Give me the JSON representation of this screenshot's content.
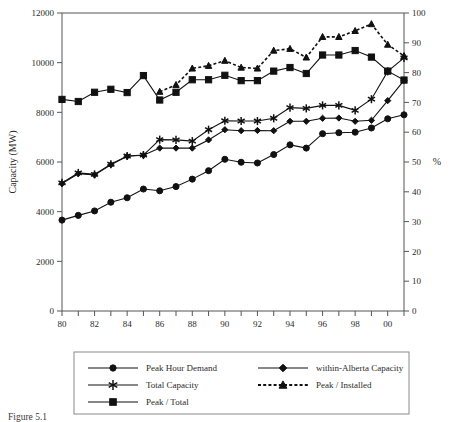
{
  "chart_data": {
    "type": "line",
    "title": "",
    "xlabel": "",
    "ylabel": "Capacity (MW)",
    "y2label": "%",
    "xlim": [
      80,
      101
    ],
    "ylim": [
      0,
      12000
    ],
    "y2lim": [
      0,
      100
    ],
    "grid": false,
    "legend_position": "below-plot",
    "x": [
      80,
      81,
      82,
      83,
      84,
      85,
      86,
      87,
      88,
      89,
      90,
      91,
      92,
      93,
      94,
      95,
      96,
      97,
      98,
      99,
      100,
      101
    ],
    "xtick_labels": [
      "80",
      "",
      "82",
      "",
      "84",
      "",
      "86",
      "",
      "88",
      "",
      "90",
      "",
      "92",
      "",
      "94",
      "",
      "96",
      "",
      "98",
      "",
      "00",
      ""
    ],
    "ytick_labels": [
      "0",
      "2000",
      "4000",
      "6000",
      "8000",
      "10000",
      "12000"
    ],
    "ytick_values": [
      0,
      2000,
      4000,
      6000,
      8000,
      10000,
      12000
    ],
    "y2tick_labels": [
      "0",
      "10",
      "20",
      "30",
      "40",
      "50",
      "60",
      "70",
      "80",
      "90",
      "100"
    ],
    "y2tick_values": [
      0,
      10,
      20,
      30,
      40,
      50,
      60,
      70,
      80,
      90,
      100
    ],
    "series": [
      {
        "name": "Peak Hour Demand",
        "marker": "circle",
        "linestyle": "solid",
        "axis": "left",
        "values": [
          3660,
          3850,
          4030,
          4380,
          4560,
          4910,
          4840,
          5010,
          5310,
          5650,
          6110,
          5990,
          5960,
          6300,
          6690,
          6560,
          7140,
          7180,
          7200,
          7370,
          7740,
          7900
        ]
      },
      {
        "name": "within-Alberta Capacity",
        "marker": "diamond",
        "linestyle": "solid",
        "axis": "left",
        "values": [
          5130,
          5530,
          5480,
          5890,
          6230,
          6270,
          6560,
          6560,
          6560,
          6890,
          7300,
          7260,
          7270,
          7260,
          7640,
          7640,
          7760,
          7770,
          7640,
          7680,
          8470,
          9290
        ]
      },
      {
        "name": "Total Capacity",
        "marker": "asterisk",
        "linestyle": "solid",
        "axis": "left",
        "values": [
          5160,
          5560,
          5500,
          5910,
          6240,
          6280,
          6900,
          6890,
          6840,
          7300,
          7660,
          7650,
          7650,
          7760,
          8190,
          8160,
          8280,
          8280,
          8080,
          8530,
          9650,
          10190
        ]
      },
      {
        "name": "Peak / Total",
        "marker": "square",
        "linestyle": "solid",
        "axis": "right",
        "values": [
          71.0,
          70.3,
          73.4,
          74.4,
          73.3,
          79.0,
          70.8,
          73.4,
          77.6,
          77.6,
          79.1,
          77.3,
          77.3,
          80.5,
          81.7,
          79.7,
          85.9,
          85.9,
          87.4,
          85.2,
          80.5,
          77.5
        ]
      },
      {
        "name": "Peak / Installed",
        "marker": "triangle",
        "linestyle": "dotted",
        "axis": "right",
        "values": [
          null,
          null,
          null,
          null,
          null,
          null,
          73.6,
          75.9,
          81.4,
          82.3,
          84.0,
          81.7,
          81.4,
          87.4,
          88.0,
          85.1,
          92.0,
          92.0,
          94.0,
          96.3,
          89.4,
          85.6
        ]
      }
    ]
  },
  "axes": {
    "left_title": "Capacity (MW)",
    "right_title": "%"
  },
  "legend": {
    "entries": [
      {
        "label": "Peak Hour Demand",
        "marker": "circle",
        "style": "solid"
      },
      {
        "label": "within-Alberta Capacity",
        "marker": "diamond",
        "style": "solid"
      },
      {
        "label": "Total Capacity",
        "marker": "asterisk",
        "style": "solid"
      },
      {
        "label": "Peak / Installed",
        "marker": "triangle",
        "style": "dotted"
      },
      {
        "label": "Peak / Total",
        "marker": "square",
        "style": "solid"
      }
    ]
  },
  "caption": {
    "text": "Figure 5.1"
  },
  "colors": {
    "ink": "#111111",
    "axis": "#555555",
    "background": "#ffffff"
  }
}
